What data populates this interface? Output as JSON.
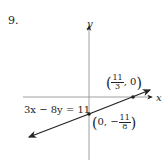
{
  "problem_number": "9.",
  "axes": {
    "x_label": "x",
    "y_label": "y"
  },
  "equation": "3x − 8y = 11",
  "points": [
    {
      "name": "x-intercept",
      "x_num": "11",
      "x_den": "3",
      "y": "0"
    },
    {
      "name": "y-intercept",
      "x": "0",
      "y_sign": "−",
      "y_num": "11",
      "y_den": "8"
    }
  ],
  "colors": {
    "ink": "#222222",
    "axis": "#888888"
  }
}
